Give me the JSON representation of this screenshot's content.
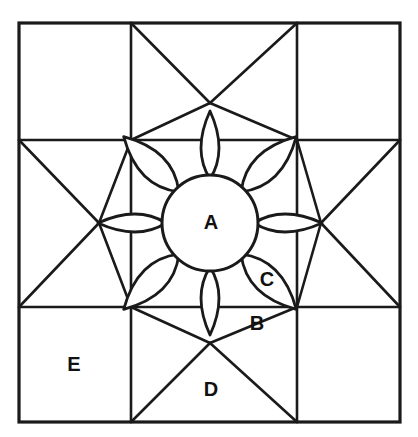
{
  "diagram": {
    "type": "quilt-block-pattern",
    "title": "",
    "background_color": "#ffffff",
    "line_color": "#1a1a1a",
    "fill_color": "#ffffff",
    "block": {
      "outline": {
        "x": 19,
        "y": 23,
        "width": 381,
        "height": 399
      },
      "grid_vertical_lines": [
        131,
        297
      ],
      "grid_horizontal_lines": [
        140,
        307
      ]
    },
    "center": {
      "cx": 210,
      "cy": 223,
      "r": 48
    },
    "petals": {
      "count": 8,
      "axis_petal_tip_radius": 112,
      "diagonal_petal_tip_radius": 122,
      "axis_petal_half_width": 18,
      "diagonal_petal_half_width": 26
    },
    "labels": [
      {
        "id": "A",
        "text": "A",
        "x": 211,
        "y": 224,
        "name": "patch-label-a"
      },
      {
        "id": "B",
        "text": "B",
        "x": 257,
        "y": 325,
        "name": "patch-label-b"
      },
      {
        "id": "C",
        "text": "C",
        "x": 267,
        "y": 281,
        "name": "patch-label-c"
      },
      {
        "id": "D",
        "text": "D",
        "x": 211,
        "y": 391,
        "name": "patch-label-d"
      },
      {
        "id": "E",
        "text": "E",
        "x": 74,
        "y": 366,
        "name": "patch-label-e"
      }
    ]
  }
}
